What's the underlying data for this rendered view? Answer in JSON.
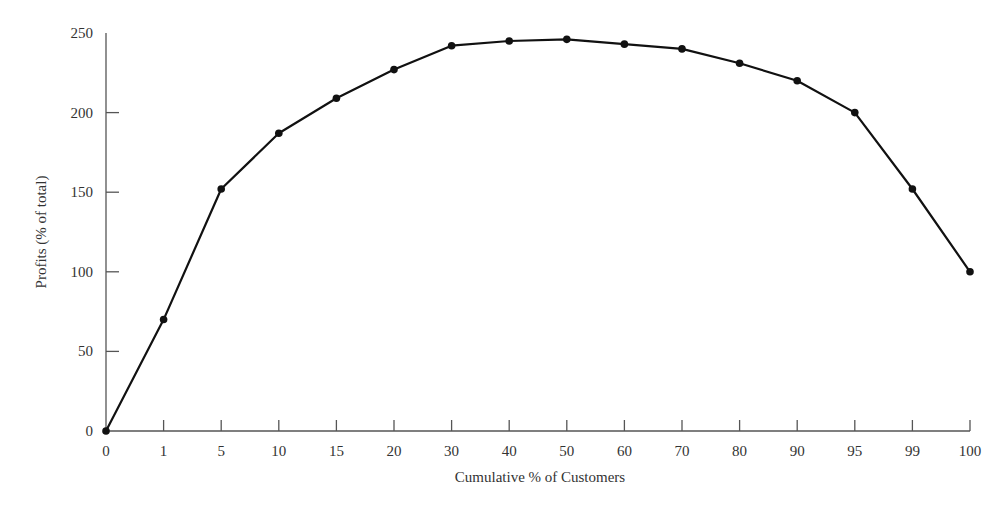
{
  "chart_data": {
    "type": "line",
    "title": "",
    "xlabel": "Cumulative % of Customers",
    "ylabel": "Profits (% of total)",
    "categories": [
      "0",
      "1",
      "5",
      "10",
      "15",
      "20",
      "30",
      "40",
      "50",
      "60",
      "70",
      "80",
      "90",
      "95",
      "99",
      "100"
    ],
    "series": [
      {
        "name": "Cumulative profits",
        "values": [
          0,
          70,
          152,
          187,
          209,
          227,
          242,
          245,
          246,
          243,
          240,
          231,
          220,
          200,
          152,
          100
        ]
      }
    ],
    "yticks": [
      0,
      50,
      100,
      150,
      200,
      250
    ],
    "ylim": [
      0,
      250
    ],
    "grid": false,
    "legend": "none",
    "markers": true
  }
}
